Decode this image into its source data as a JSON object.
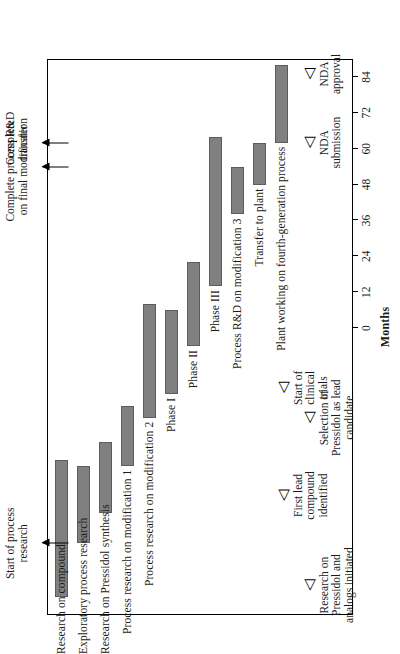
{
  "chart_data": {
    "type": "bar",
    "orientation": "gantt-horizontal-rotated-90ccw",
    "title": "",
    "xlabel": "Months",
    "ylabel": "",
    "xlim": [
      -96,
      90
    ],
    "xticks": [
      0,
      12,
      24,
      36,
      48,
      60,
      72,
      84
    ],
    "xticklabels": [
      "0",
      "12",
      "24",
      "36",
      "48",
      "60",
      "72",
      "84"
    ],
    "grid": false,
    "legend": null,
    "bar_color": "#808080",
    "frame_color": "#000000",
    "categories": [
      "Research on compound",
      "Exploratory process research",
      "Research on Pressidol synthesis",
      "Process research on modification 1",
      "Process research on modification 2",
      "Phase I",
      "Phase II",
      "Phase III",
      "Process R&D on modification 3",
      "Transfer to plant",
      "Plant working on fourth-generation process"
    ],
    "tasks": [
      {
        "label": "Research on compound",
        "start": -90,
        "end": -44
      },
      {
        "label": "Exploratory process research",
        "start": -72,
        "end": -46
      },
      {
        "label": "Research on Pressidol synthesis",
        "start": -62,
        "end": -38
      },
      {
        "label": "Process research on modification 1",
        "start": -46,
        "end": -26
      },
      {
        "label": "Process research on modification 2",
        "start": -30,
        "end": 8
      },
      {
        "label": "Phase I",
        "start": -22,
        "end": 6
      },
      {
        "label": "Phase II",
        "start": -6,
        "end": 22
      },
      {
        "label": "Phase III",
        "start": 14,
        "end": 64
      },
      {
        "label": "Process R&D on modification 3",
        "start": 38,
        "end": 54
      },
      {
        "label": "Transfer to plant",
        "start": 48,
        "end": 62
      },
      {
        "label": "Plant working on fourth-generation process",
        "start": 62,
        "end": 88
      }
    ],
    "milestones": [
      {
        "label": "Research on Pressidol and analogs initiated",
        "month": -86
      },
      {
        "label": "First lead compound identified",
        "month": -56
      },
      {
        "label": "Selection of Pressidol as lead candidate",
        "month": -30
      },
      {
        "label": "Start of clinical trials",
        "month": -20
      },
      {
        "label": "NDA submission",
        "month": 62
      },
      {
        "label": "NDA approval",
        "month": 85
      }
    ],
    "annotations": [
      {
        "label": "Start of process research",
        "month": -72
      },
      {
        "label": "Complete process R&D on final modification",
        "month": 54
      },
      {
        "label": "Complete transfer",
        "month": 62
      }
    ]
  },
  "axis": {
    "title": "Months",
    "ticks": [
      "0",
      "12",
      "24",
      "36",
      "48",
      "60",
      "72",
      "84"
    ]
  },
  "tasks": [
    {
      "name": "Research on compound"
    },
    {
      "name": "Exploratory process research"
    },
    {
      "name": "Research on Pressidol synthesis"
    },
    {
      "name": "Process research on modification 1"
    },
    {
      "name": "Process research on modification 2"
    },
    {
      "name": "Phase I"
    },
    {
      "name": "Phase II"
    },
    {
      "name": "Phase III"
    },
    {
      "name": "Process R&D on modification 3"
    },
    {
      "name": "Transfer to plant"
    },
    {
      "name": "Plant working on fourth-generation process"
    }
  ],
  "milestones": [
    {
      "line1": "Research on",
      "line2": "Pressidol and",
      "line3": "analogs initiated"
    },
    {
      "line1": "First lead",
      "line2": "compound",
      "line3": "identified"
    },
    {
      "line1": "Selection of",
      "line2": "Pressidol as lead",
      "line3": "candidate"
    },
    {
      "line1": "Start of",
      "line2": "clinical",
      "line3": "trials"
    },
    {
      "line1": "NDA",
      "line2": "submission",
      "line3": ""
    },
    {
      "line1": "NDA",
      "line2": "approval",
      "line3": ""
    }
  ],
  "annotations": [
    {
      "line1": "Start of process",
      "line2": "research",
      "line3": ""
    },
    {
      "line1": "Complete process R&D",
      "line2": "on final modification",
      "line3": ""
    },
    {
      "line1": "Complete",
      "line2": "transfer",
      "line3": ""
    }
  ],
  "icons": {
    "milestone": "triangle-marker-icon",
    "pointer": "arrow-right-icon"
  }
}
